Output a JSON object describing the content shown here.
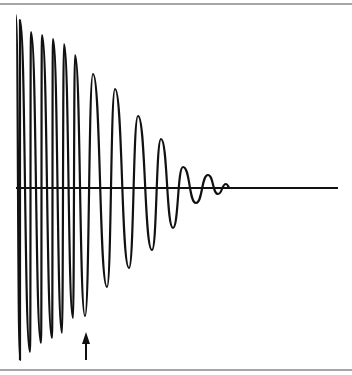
{
  "figure": {
    "frame": {
      "top_y": 4,
      "bottom_y": 370,
      "color": "#888888"
    },
    "axis": {
      "y": 188,
      "x_start": 16,
      "x_end": 338,
      "color": "#111111"
    },
    "wave_color": "#111111",
    "extrema": [
      [
        16,
        15
      ],
      [
        20,
        360
      ],
      [
        20,
        20
      ],
      [
        30,
        352
      ],
      [
        31,
        32
      ],
      [
        41,
        343
      ],
      [
        42,
        35
      ],
      [
        52,
        338
      ],
      [
        53,
        39
      ],
      [
        62,
        333
      ],
      [
        64,
        44
      ],
      [
        73,
        318
      ],
      [
        75,
        55
      ],
      [
        85,
        316
      ],
      [
        93,
        74
      ],
      [
        107,
        287
      ],
      [
        115,
        89
      ],
      [
        129,
        268
      ],
      [
        138,
        116
      ],
      [
        152,
        250
      ],
      [
        161,
        139
      ],
      [
        173,
        228
      ],
      [
        183,
        167
      ],
      [
        196,
        203
      ],
      [
        208,
        175
      ],
      [
        218,
        194
      ],
      [
        226,
        184
      ],
      [
        230,
        188
      ]
    ],
    "arrow": {
      "x": 86,
      "tip_y": 332,
      "base_y": 360
    }
  }
}
